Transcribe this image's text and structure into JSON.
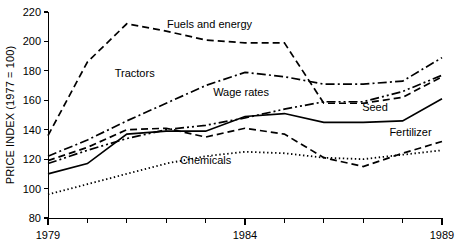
{
  "chart_data": {
    "type": "line",
    "title": "",
    "xlabel": "",
    "ylabel": "PRICE INDEX (1977 = 100)",
    "xlim": [
      1979,
      1989
    ],
    "ylim": [
      80,
      220
    ],
    "grid": false,
    "legend_position": "inline-annotations",
    "x": [
      1979,
      1980,
      1981,
      1982,
      1983,
      1984,
      1985,
      1986,
      1987,
      1988,
      1989
    ],
    "x_tick_labels": [
      "1979",
      "1984",
      "1989"
    ],
    "x_tick_values": [
      1979,
      1984,
      1989
    ],
    "y_tick_labels": [
      "80",
      "100",
      "120",
      "140",
      "160",
      "180",
      "200",
      "220"
    ],
    "y_tick_values": [
      80,
      100,
      120,
      140,
      160,
      180,
      200,
      220
    ],
    "series": [
      {
        "name": "Fuels and energy",
        "style": "dashed",
        "label_x": 1983.1,
        "label_y": 209,
        "values": [
          136,
          186,
          212,
          207,
          201,
          199,
          199,
          158,
          158,
          162,
          176
        ]
      },
      {
        "name": "Tractors",
        "style": "dash-dot",
        "label_x": 1981.2,
        "label_y": 176,
        "values": [
          122,
          133,
          146,
          158,
          170,
          179,
          176,
          171,
          171,
          173,
          189
        ]
      },
      {
        "name": "Wage rates",
        "style": "dash-dot-dot",
        "label_x": 1983.9,
        "label_y": 163,
        "values": [
          117,
          126,
          134,
          140,
          143,
          148,
          154,
          159,
          159,
          166,
          177
        ]
      },
      {
        "name": "Seed",
        "style": "solid",
        "label_x": 1987.3,
        "label_y": 153,
        "values": [
          110,
          117,
          137,
          139,
          139,
          149,
          151,
          145,
          145,
          146,
          161
        ]
      },
      {
        "name": "Fertilizer",
        "style": "dashed",
        "label_x": 1988.2,
        "label_y": 136,
        "values": [
          119,
          128,
          140,
          141,
          135,
          141,
          137,
          121,
          115,
          124,
          132
        ]
      },
      {
        "name": "Chemicals",
        "style": "dotted",
        "label_x": 1983.0,
        "label_y": 117,
        "values": [
          96,
          103,
          110,
          117,
          122,
          125,
          124,
          121,
          120,
          123,
          126
        ]
      }
    ]
  }
}
